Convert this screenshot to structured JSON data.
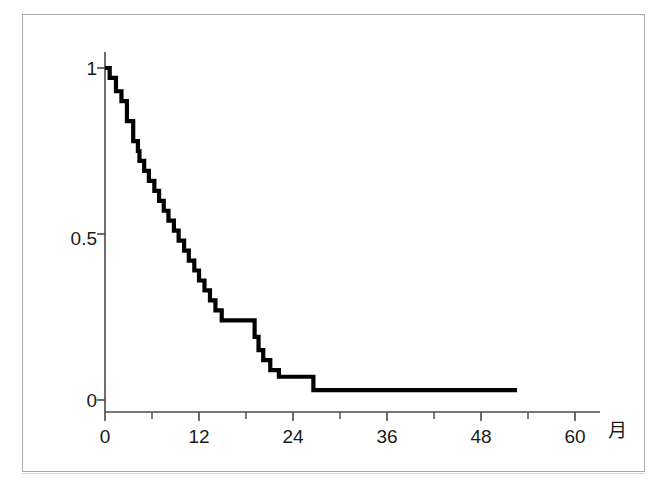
{
  "figure": {
    "kind": "kaplan-meier-survival-curve",
    "background_color": "#ffffff",
    "frame_color": "#a8a8a8",
    "curve_color": "#000000"
  },
  "axis": {
    "x_name": "月",
    "y_name": "",
    "x_tick_labels": [
      "0",
      "12",
      "24",
      "36",
      "48",
      "60"
    ],
    "y_tick_labels": [
      "1",
      "0.5",
      "0"
    ]
  },
  "chart_data": {
    "type": "line",
    "title": "",
    "subtitle": "",
    "xlabel": "月",
    "ylabel": "",
    "xlim": [
      0,
      62
    ],
    "ylim": [
      0,
      1.05
    ],
    "xticks": [
      0,
      12,
      24,
      36,
      48,
      60
    ],
    "xtick_labels": [
      "0",
      "12",
      "24",
      "36",
      "48",
      "60"
    ],
    "x_minor_ticks": [
      6,
      18,
      30,
      42,
      54
    ],
    "yticks": [
      0,
      0.5,
      1
    ],
    "ytick_labels": [
      "0",
      "0.5",
      "1"
    ],
    "grid": false,
    "legend": false,
    "step_style": "post",
    "series": [
      {
        "name": "生存率",
        "x": [
          0.0,
          0.6,
          1.4,
          2.1,
          2.8,
          3.6,
          4.2,
          4.4,
          5.0,
          5.6,
          6.3,
          6.9,
          7.5,
          8.1,
          8.8,
          9.4,
          10.1,
          10.7,
          11.4,
          12.0,
          12.7,
          13.4,
          14.1,
          14.9,
          18.4,
          19.1,
          19.6,
          20.2,
          21.1,
          22.2,
          26.6,
          52.6
        ],
        "y": [
          1.0,
          0.97,
          0.93,
          0.9,
          0.84,
          0.78,
          0.75,
          0.72,
          0.69,
          0.66,
          0.63,
          0.6,
          0.57,
          0.54,
          0.51,
          0.48,
          0.45,
          0.42,
          0.39,
          0.36,
          0.33,
          0.3,
          0.27,
          0.24,
          0.24,
          0.19,
          0.15,
          0.12,
          0.09,
          0.07,
          0.03,
          0.03
        ]
      }
    ],
    "annotations": []
  }
}
